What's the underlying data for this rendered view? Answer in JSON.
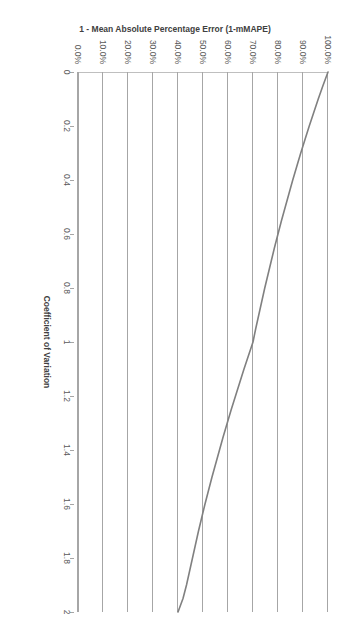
{
  "chart_data": {
    "type": "line",
    "title": "",
    "xlabel": "Coefficient of Variation",
    "ylabel": "1 - Mean Absolute Percentage Error (1-mMAPE)",
    "xlim": [
      0,
      2
    ],
    "ylim": [
      0,
      1
    ],
    "grid": true,
    "grid_axis": "y",
    "legend": "none",
    "orientation": "rotated-90-clockwise",
    "series_color": "#808080",
    "x_ticklabels": [
      "0",
      "0.2",
      "0.4",
      "0.6",
      "0.8",
      "1",
      "1.2",
      "1.4",
      "1.6",
      "1.8",
      "2"
    ],
    "x_tickvalues": [
      0,
      0.2,
      0.4,
      0.6,
      0.8,
      1,
      1.2,
      1.4,
      1.6,
      1.8,
      2
    ],
    "y_ticklabels": [
      "0.0%",
      "10.0%",
      "20.0%",
      "30.0%",
      "40.0%",
      "50.0%",
      "60.0%",
      "70.0%",
      "80.0%",
      "90.0%",
      "100.0%"
    ],
    "y_tickvalues": [
      0,
      0.1,
      0.2,
      0.3,
      0.4,
      0.5,
      0.6,
      0.7,
      0.8,
      0.9,
      1.0
    ],
    "series": [
      {
        "name": "1-mMAPE vs Coefficient of Variation",
        "x": [
          0.0,
          0.05,
          0.1,
          0.15,
          0.2,
          0.25,
          0.3,
          0.35,
          0.4,
          0.45,
          0.5,
          0.55,
          0.6,
          0.65,
          0.7,
          0.75,
          0.8,
          0.85,
          0.9,
          0.95,
          1.0,
          1.05,
          1.1,
          1.15,
          1.2,
          1.25,
          1.3,
          1.35,
          1.4,
          1.45,
          1.5,
          1.55,
          1.6,
          1.65,
          1.7,
          1.75,
          1.8,
          1.85,
          1.9,
          1.95,
          2.0
        ],
        "y": [
          1.0,
          0.98,
          0.961,
          0.943,
          0.925,
          0.908,
          0.891,
          0.875,
          0.859,
          0.844,
          0.829,
          0.814,
          0.8,
          0.786,
          0.773,
          0.76,
          0.747,
          0.735,
          0.723,
          0.711,
          0.7,
          0.682,
          0.664,
          0.647,
          0.63,
          0.613,
          0.597,
          0.581,
          0.566,
          0.551,
          0.536,
          0.522,
          0.508,
          0.495,
          0.482,
          0.47,
          0.458,
          0.446,
          0.434,
          0.42,
          0.4
        ]
      }
    ],
    "annotations": []
  },
  "axes": {
    "x_title": "Coefficient of Variation",
    "y_title": "1 - Mean Absolute Percentage Error (1-mMAPE)"
  }
}
